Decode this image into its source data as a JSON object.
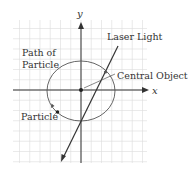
{
  "labels": {
    "y_axis": "y",
    "x_axis": "x",
    "path": [
      "Path of",
      "Particle"
    ],
    "laser": "Laser Light",
    "central": "Central Object",
    "particle": "Particle"
  },
  "colors": {
    "grid": "#d9d9d9",
    "ink": "#333333",
    "background": "#ffffff"
  },
  "geometry": {
    "grid": {
      "x0": 13,
      "y0": 20,
      "x1": 147,
      "y1": 163,
      "spacing": 10.25
    },
    "origin": [
      81,
      90
    ],
    "ellipse": {
      "cx": 81,
      "cy": 91,
      "rx": 34,
      "ry": 30
    },
    "laser": {
      "from": [
        118,
        46
      ],
      "to": [
        62,
        160
      ]
    },
    "central_object": [
      105,
      72
    ],
    "particle": [
      57,
      112
    ]
  }
}
